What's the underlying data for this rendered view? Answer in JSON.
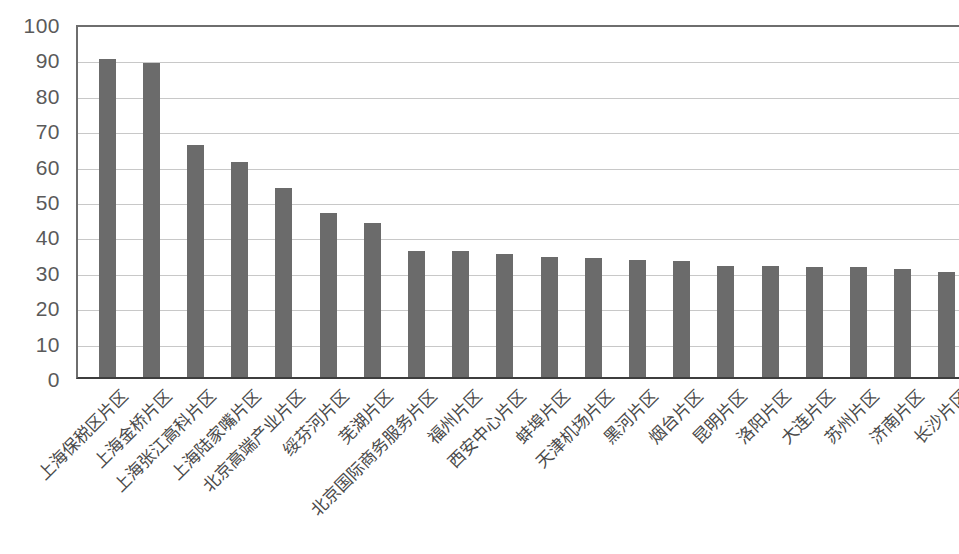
{
  "chart_data": {
    "type": "bar",
    "title": "",
    "subtitle": "",
    "xlabel": "",
    "ylabel": "",
    "ylim": [
      0,
      100
    ],
    "ytick_step": 10,
    "ytick_labels": [
      "100",
      "90",
      "80",
      "70",
      "60",
      "50",
      "40",
      "30",
      "20",
      "10",
      "0"
    ],
    "ytick_values": [
      100,
      90,
      80,
      70,
      60,
      50,
      40,
      30,
      20,
      10,
      0
    ],
    "grid": true,
    "grid_axis": "y",
    "legend": false,
    "legend_position": "none",
    "bar_color": "#6b6b6b",
    "plot_background": "#ffffff",
    "gridline_color": "#c8c8c8",
    "axis_color": "#3d3d3d",
    "categories": [
      "上海保税区片区",
      "上海金桥片区",
      "上海张江高科片区",
      "上海陆家嘴片区",
      "北京高端产业片区",
      "绥芬河片区",
      "芜湖片区",
      "北京国际商务服务片区",
      "福州片区",
      "西安中心片区",
      "蚌埠片区",
      "天津机场片区",
      "黑河片区",
      "烟台片区",
      "昆明片区",
      "洛阳片区",
      "大连片区",
      "苏州片区",
      "济南片区",
      "长沙片区"
    ],
    "values": [
      89.8,
      88.6,
      65.4,
      60.6,
      53.5,
      46.2,
      43.4,
      35.6,
      35.6,
      34.8,
      33.9,
      33.5,
      33.1,
      32.7,
      31.5,
      31.5,
      31.0,
      31.0,
      30.5,
      29.8
    ]
  }
}
